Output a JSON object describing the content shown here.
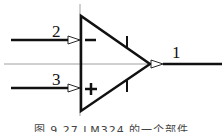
{
  "diagram": {
    "type": "op-amp schematic symbol",
    "pins": [
      {
        "id": "inverting",
        "number": "2",
        "sign": "−"
      },
      {
        "id": "non-inverting",
        "number": "3",
        "sign": "+"
      },
      {
        "id": "output",
        "number": "1"
      }
    ],
    "colors": {
      "stroke": "#111111",
      "guide": "#888888",
      "background": "#ffffff"
    }
  },
  "caption": "图 9.27  LM324 的一个部件"
}
